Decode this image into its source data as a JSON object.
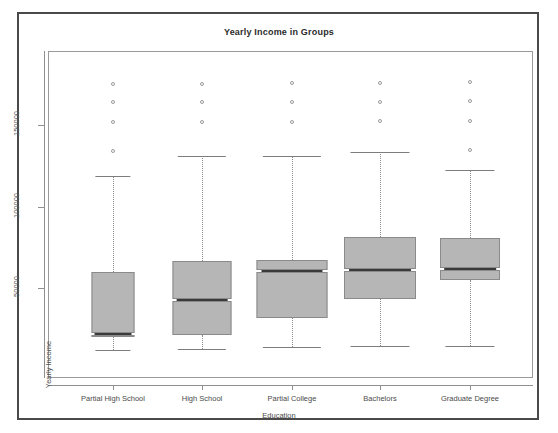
{
  "chart_data": {
    "type": "box",
    "title": "Yearly Income in Groups",
    "xlabel": "Education",
    "ylabel": "Yearly Income",
    "grid": false,
    "legend": "none",
    "ylim": [
      0,
      185000
    ],
    "yticks": [
      50000,
      100000,
      150000
    ],
    "ytick_labels": [
      "50000",
      "100000",
      "150000"
    ],
    "categories": [
      "Partial High School",
      "High School",
      "Partial College",
      "Bachelors",
      "Graduate Degree"
    ],
    "boxes": [
      {
        "category": "Partial High School",
        "whisker_low": 12000,
        "q1": 21000,
        "median": 22500,
        "q3": 60000,
        "whisker_high": 119000,
        "outliers": [
          134000,
          152000,
          164000,
          175000
        ],
        "box_width_px": 43
      },
      {
        "category": "High School",
        "whisker_low": 13000,
        "q1": 21500,
        "median": 43500,
        "q3": 67000,
        "whisker_high": 131000,
        "outliers": [
          152000,
          164000,
          175000
        ],
        "box_width_px": 59
      },
      {
        "category": "Partial College",
        "whisker_low": 14000,
        "q1": 32000,
        "median": 61500,
        "q3": 67500,
        "whisker_high": 131000,
        "outliers": [
          152000,
          164000,
          176000
        ],
        "box_width_px": 71
      },
      {
        "category": "Bachelors",
        "whisker_low": 15000,
        "q1": 43500,
        "median": 62000,
        "q3": 81500,
        "whisker_high": 133500,
        "outliers": [
          152500,
          164000,
          176000
        ],
        "box_width_px": 72
      },
      {
        "category": "Graduate Degree",
        "whisker_low": 14500,
        "q1": 55000,
        "median": 62500,
        "q3": 81000,
        "whisker_high": 122500,
        "outliers": [
          134500,
          152500,
          164500,
          176500
        ],
        "box_width_px": 60
      }
    ],
    "colors": {
      "box_fill": "#b6b6b6",
      "box_border": "#8a8a8a",
      "median": "#3a3a3a",
      "whisker": "#8c8c8c",
      "outlier": "#9a9a9a",
      "axis": "#8f8f8f",
      "frame": "#4a4a4a",
      "text": "#4a4a4a"
    }
  }
}
